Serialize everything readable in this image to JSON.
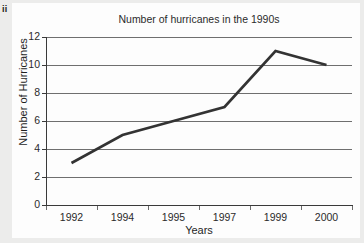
{
  "part_marker": "ii",
  "chart_data": {
    "type": "line",
    "title": "Number of hurricanes in the 1990s",
    "xlabel": "Years",
    "ylabel": "Number of Hurricanes",
    "categories": [
      "1992",
      "1994",
      "1995",
      "1997",
      "1999",
      "2000"
    ],
    "values": [
      3,
      5,
      6,
      7,
      11,
      10
    ],
    "series": [
      {
        "name": "Number of Hurricanes",
        "values": [
          3,
          5,
          6,
          7,
          11,
          10
        ]
      }
    ],
    "ylim": [
      0,
      12
    ],
    "ytick_labels": [
      "0",
      "2",
      "4",
      "6",
      "8",
      "10",
      "12"
    ],
    "ytick_values": [
      0,
      2,
      4,
      6,
      8,
      10,
      12
    ],
    "ytick_step": 2,
    "grid": "horizontal",
    "legend": "none",
    "line_color": "#333333",
    "grid_color": "#6f6f6f",
    "axis_color": "#3a3a3a",
    "background_color": "#fdfdfd",
    "page_background_color": "#ececeb",
    "markers": "none"
  }
}
